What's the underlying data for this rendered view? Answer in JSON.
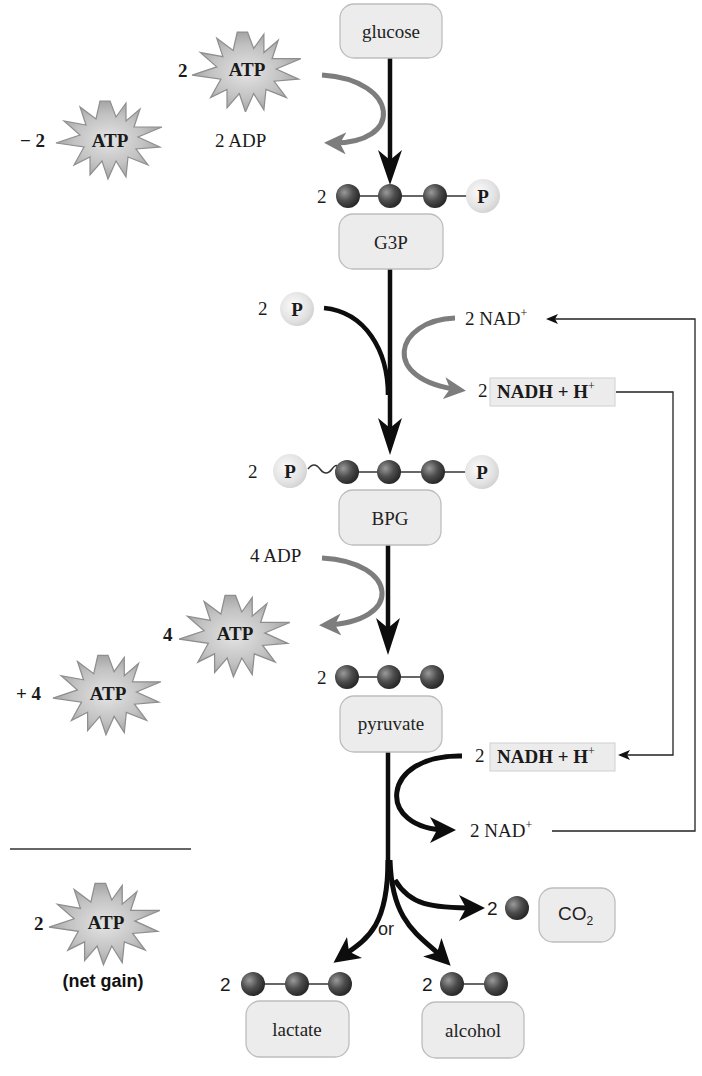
{
  "colors": {
    "box_fill": "#ececec",
    "box_stroke": "#bdbdbd",
    "main_arrow": "#0d0d0d",
    "gray_arrow": "#7d7d7d",
    "atp_fill": "#b3b3b3",
    "carbon_ball": "#4a4a4a",
    "phosphate_ball": "#e6e6e6",
    "nadh_box": "#ececec"
  },
  "molecules": {
    "glucose": "glucose",
    "g3p": "G3P",
    "bpg": "BPG",
    "pyruvate": "pyruvate",
    "lactate": "lactate",
    "alcohol": "alcohol",
    "co2": "CO",
    "co2_sub": "2"
  },
  "atp": {
    "label": "ATP",
    "invest_count": "2",
    "invest_total": "− 2",
    "payoff_count": "4",
    "payoff_total": "+ 4",
    "net_count": "2",
    "net_label": "(net gain)"
  },
  "adp": {
    "step1": "2 ADP",
    "step3": "4 ADP"
  },
  "phosphate": {
    "symbol": "P",
    "inorganic_count": "2"
  },
  "counts": {
    "g3p": "2",
    "bpg": "2",
    "pyruvate": "2",
    "lactate": "2",
    "alcohol": "2",
    "co2": "2",
    "nadh_top": "2",
    "nadh_bottom": "2",
    "nad_top": "2",
    "nad_bottom": "2"
  },
  "cofactors": {
    "nad": "NAD",
    "nad_sup": "+",
    "nadh": "NADH + H",
    "nadh_sup": "+"
  },
  "branch_label": "or"
}
